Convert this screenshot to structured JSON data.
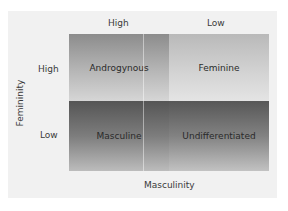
{
  "columns": {
    "high": "High",
    "low": "Low"
  },
  "rows": {
    "high": "High",
    "low": "Low"
  },
  "axes": {
    "x_label": "Masculinity",
    "y_label": "Femininity"
  },
  "cells": {
    "androgynous": "Androgynous",
    "feminine": "Feminine",
    "masculine": "Masculine",
    "undifferentiated": "Undifferentiated"
  }
}
